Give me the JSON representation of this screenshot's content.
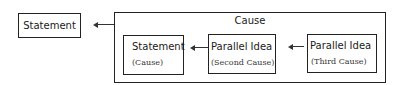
{
  "diagram": {
    "outer_statement": {
      "label": "Statement"
    },
    "cause_group": {
      "title": "Cause",
      "boxes": [
        {
          "label": "Statement",
          "sublabel": "(Cause)"
        },
        {
          "label": "Parallel Idea",
          "sublabel": "(Second Cause)"
        },
        {
          "label": "Parallel Idea",
          "sublabel": "(Third Cause)"
        }
      ]
    },
    "arrows": [
      {
        "from": "Cause",
        "to": "Statement"
      },
      {
        "from": "Parallel Idea (Second Cause)",
        "to": "Statement (Cause)"
      },
      {
        "from": "Parallel Idea (Third Cause)",
        "to": "Parallel Idea (Second Cause)"
      }
    ]
  }
}
